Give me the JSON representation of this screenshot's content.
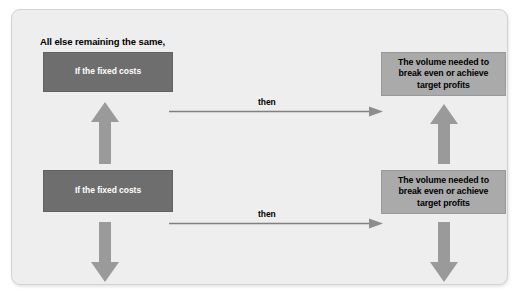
{
  "figure": {
    "heading": "All else remaining the same,",
    "colors": {
      "panel_background": "#eeeeee",
      "panel_border": "#d2d2d2",
      "cause_box": "#6e6e6e",
      "cause_box_text": "#ffffff",
      "effect_box": "#aaaaaa",
      "effect_box_text": "#000000",
      "block_arrow": "#9a9a9a",
      "connector_line": "#808080",
      "page_background": "#ffffff"
    },
    "rows": [
      {
        "cause_label": "If the fixed costs",
        "cause_direction_icon": "arrow-up-icon",
        "connector_label": "then",
        "effect_label": "The volume needed to break even or achieve target profits",
        "effect_line_1": "The volume needed to",
        "effect_line_2": "break even or achieve",
        "effect_line_3": "target profits",
        "effect_direction_icon": "arrow-up-icon"
      },
      {
        "cause_label": "If the fixed costs",
        "cause_direction_icon": "arrow-down-icon",
        "connector_label": "then",
        "effect_label": "The volume needed to break even or achieve target profits",
        "effect_line_1": "The volume needed to",
        "effect_line_2": "break even or achieve",
        "effect_line_3": "target profits",
        "effect_direction_icon": "arrow-down-icon"
      }
    ]
  }
}
